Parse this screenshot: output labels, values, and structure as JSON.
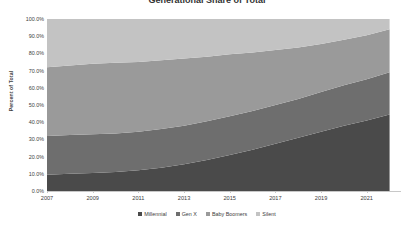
{
  "chart_data": {
    "type": "area",
    "stacked": true,
    "stack_mode": "percent",
    "title": "Generational Share of Total",
    "xlabel": "",
    "ylabel": "Percent of Total",
    "ylim": [
      0,
      100
    ],
    "ytick_labels": [
      "100.0%",
      "90.0%",
      "80.0%",
      "70.0%",
      "60.0%",
      "50.0%",
      "40.0%",
      "30.0%",
      "20.0%",
      "10.0%",
      "0.0%"
    ],
    "ytick_values": [
      100,
      90,
      80,
      70,
      60,
      50,
      40,
      30,
      20,
      10,
      0
    ],
    "xtick_labels": [
      "2007",
      "2009",
      "2011",
      "2013",
      "2015",
      "2017",
      "2019",
      "2021"
    ],
    "xtick_values": [
      2007,
      2009,
      2011,
      2013,
      2015,
      2017,
      2019,
      2021
    ],
    "xlim": [
      2007,
      2022.5
    ],
    "grid": false,
    "legend_position": "bottom",
    "x": [
      2007,
      2008,
      2009,
      2010,
      2011,
      2012,
      2013,
      2014,
      2015,
      2016,
      2017,
      2018,
      2019,
      2020,
      2021,
      2022
    ],
    "series": [
      {
        "name": "Millennial",
        "color": "#4a4a4a",
        "values": [
          9.5,
          10.0,
          10.5,
          11.0,
          12.0,
          13.5,
          15.5,
          18.0,
          21.0,
          24.0,
          27.5,
          31.0,
          34.5,
          38.0,
          41.0,
          44.5
        ]
      },
      {
        "name": "Gen X",
        "color": "#6e6e6e",
        "values": [
          22.5,
          22.5,
          22.5,
          22.5,
          22.5,
          22.5,
          22.5,
          22.5,
          22.5,
          22.5,
          22.5,
          22.5,
          23.0,
          23.5,
          24.0,
          24.5
        ]
      },
      {
        "name": "Baby Boomers",
        "color": "#9a9a9a",
        "values": [
          40.0,
          40.5,
          41.0,
          41.0,
          40.5,
          40.0,
          39.0,
          37.5,
          36.0,
          34.0,
          32.0,
          30.0,
          28.0,
          26.5,
          25.5,
          25.0
        ]
      },
      {
        "name": "Silent",
        "color": "#c3c3c3",
        "values": [
          28.0,
          27.0,
          26.0,
          25.5,
          25.0,
          24.0,
          23.0,
          22.0,
          20.5,
          19.5,
          18.0,
          16.5,
          14.5,
          12.0,
          9.5,
          6.0
        ]
      }
    ],
    "legend": [
      {
        "label": "Millennial",
        "color": "#4a4a4a"
      },
      {
        "label": "Gen X",
        "color": "#6e6e6e"
      },
      {
        "label": "Baby Boomers",
        "color": "#9a9a9a"
      },
      {
        "label": "Silent",
        "color": "#c3c3c3"
      }
    ]
  }
}
